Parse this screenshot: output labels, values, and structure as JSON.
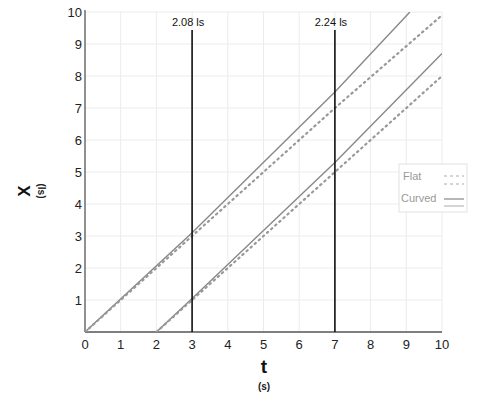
{
  "chart_data": {
    "type": "line",
    "title": "",
    "xlabel": "t",
    "xlabel_unit": "(s)",
    "ylabel": "X",
    "ylabel_unit": "(ls)",
    "xlim": [
      0,
      10
    ],
    "ylim": [
      0,
      10
    ],
    "x_ticks": [
      "0",
      "1",
      "2",
      "3",
      "4",
      "5",
      "6",
      "7",
      "8",
      "9",
      "10"
    ],
    "y_ticks": [
      "1",
      "2",
      "3",
      "4",
      "5",
      "6",
      "7",
      "8",
      "9",
      "10"
    ],
    "grid": true,
    "legend_position": "right-middle",
    "legend": [
      {
        "label": "Flat",
        "style": "dashed"
      },
      {
        "label": "Curved",
        "style": "solid"
      }
    ],
    "series": [
      {
        "name": "Curved (from t=0)",
        "style": "solid",
        "points": [
          [
            0,
            0
          ],
          [
            3,
            3.1
          ],
          [
            7,
            7.5
          ],
          [
            9.1,
            10
          ]
        ]
      },
      {
        "name": "Flat (from t=0)",
        "style": "dotted",
        "points": [
          [
            0,
            0
          ],
          [
            3,
            3.0
          ],
          [
            7,
            7.0
          ],
          [
            10,
            9.9
          ]
        ]
      },
      {
        "name": "Curved (from t=2)",
        "style": "solid",
        "points": [
          [
            2,
            0
          ],
          [
            3,
            1.05
          ],
          [
            7,
            5.3
          ],
          [
            10,
            8.7
          ]
        ]
      },
      {
        "name": "Flat (from t=2)",
        "style": "dotted",
        "points": [
          [
            2,
            0
          ],
          [
            3,
            1.0
          ],
          [
            7,
            5.0
          ],
          [
            10,
            8.0
          ]
        ]
      }
    ],
    "annotations": [
      {
        "x": 3,
        "label": "2.08 ls",
        "type": "vertical-line"
      },
      {
        "x": 7,
        "label": "2.24 ls",
        "type": "vertical-line"
      }
    ]
  }
}
